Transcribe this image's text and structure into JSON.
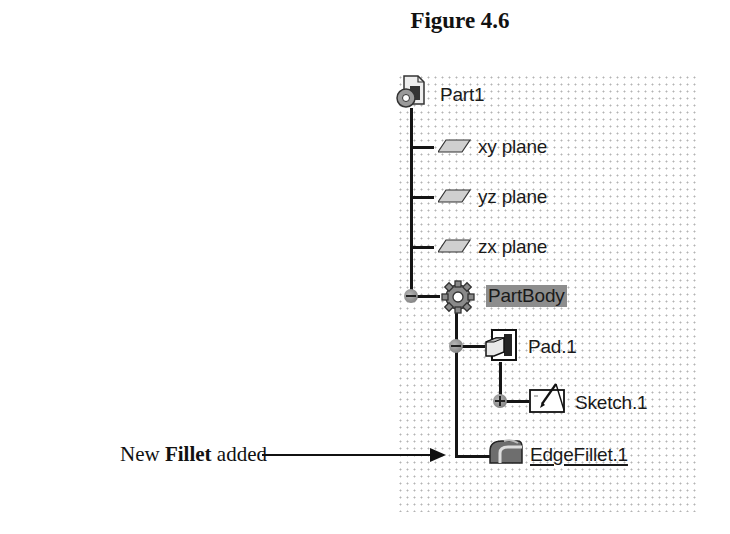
{
  "figure": {
    "title": "Figure 4.6"
  },
  "tree": {
    "root": {
      "label": "Part1",
      "icon": "part-document-icon"
    },
    "planes": [
      {
        "label": "xy plane",
        "icon": "plane-icon"
      },
      {
        "label": "yz plane",
        "icon": "plane-icon"
      },
      {
        "label": "zx plane",
        "icon": "plane-icon"
      }
    ],
    "body": {
      "label": "PartBody",
      "icon": "body-gear-icon",
      "highlighted": true,
      "highlight_color": "#8d8d8d"
    },
    "features": [
      {
        "label": "Pad.1",
        "icon": "pad-icon",
        "expanded": true,
        "children": [
          {
            "label": "Sketch.1",
            "icon": "sketch-icon",
            "expanded": false
          }
        ]
      },
      {
        "label": "EdgeFillet.1",
        "icon": "edge-fillet-icon",
        "underlined": true
      }
    ]
  },
  "annotation": {
    "prefix": "New ",
    "bold": "Fillet",
    "suffix": " added"
  }
}
